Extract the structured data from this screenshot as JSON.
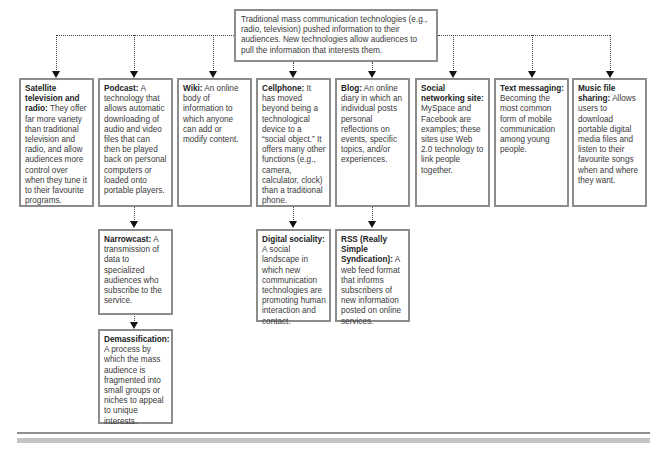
{
  "top_box": {
    "text": "Traditional mass communication technologies (e.g., radio, television) pushed information to their audiences. New technologies allow audiences to pull the information that interests them."
  },
  "boxes": [
    {
      "term": "Satellite television and radio:",
      "text": " They offer far more variety than traditional television and radio, and allow audiences more control over when they tune it to their favourite programs."
    },
    {
      "term": "Podcast:",
      "text": " A technology that allows automatic downloading of audio and video files that can then be played back on personal computers or loaded onto portable players."
    },
    {
      "term": "Wiki:",
      "text": " An online body of information to which anyone can add or modify content."
    },
    {
      "term": "Cellphone:",
      "text": " It has moved beyond being a technological device to a “social object.” It offers many other functions (e.g., camera, calculator, clock) than a traditional phone."
    },
    {
      "term": "Blog:",
      "text": " An online diary in which an individual posts personal reflections on events, specific topics, and/or experiences."
    },
    {
      "term": "Social networking site:",
      "text": " MySpace and Facebook are examples; these sites use Web 2.0 technology to link people together."
    },
    {
      "term": "Text messaging:",
      "text": " Becoming the most common form of mobile communication among young people."
    },
    {
      "term": "Music file sharing:",
      "text": " Allows users to download portable digital media files and listen to their favourite songs when and where they want."
    }
  ],
  "sub_boxes": {
    "narrowcast": {
      "term": "Narrowcast:",
      "text": " A transmission of data to specialized audiences who subscribe to the service."
    },
    "demassification": {
      "term": "Demassification:",
      "text": " A process by which the mass audience is fragmented into small groups or niches to appeal to unique interests."
    },
    "digital_sociality": {
      "term": "Digital sociality:",
      "text": " A social landscape in which new communication technologies are promoting human interaction and contact."
    },
    "rss": {
      "term": "RSS (Really Simple Syndication):",
      "text": " A web feed format that informs subscribers of new information posted on online services."
    }
  },
  "colors": {
    "border": "#8c8c8c",
    "connector": "#444444",
    "arrow": "#111111",
    "rule_dark": "#8f8f8f",
    "rule_light": "#c4c4c4"
  }
}
